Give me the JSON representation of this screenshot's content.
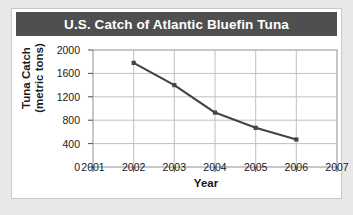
{
  "chart_data": {
    "type": "line",
    "title": "U.S. Catch of Atlantic Bluefin Tuna",
    "xlabel": "Year",
    "ylabel_line1": "Tuna Catch",
    "ylabel_line2": "(metric tons)",
    "x": [
      2002,
      2003,
      2004,
      2005,
      2006
    ],
    "values": [
      1780,
      1400,
      930,
      670,
      470
    ],
    "xticks": [
      "2001",
      "2002",
      "2003",
      "2004",
      "2005",
      "2006",
      "2007"
    ],
    "xlim": [
      2001,
      2007
    ],
    "yticks": [
      "0",
      "400",
      "800",
      "1200",
      "1600",
      "2000"
    ],
    "ylim": [
      0,
      2000
    ],
    "grid": true,
    "legend": "none",
    "series_color": "#444444",
    "title_bg_color": "#4f4f4f",
    "title_text_color": "#ffffff",
    "grid_color": "#b8b8b8",
    "page_bg_color": "#e9e8e6",
    "figure_bg_color": "#ffffff"
  }
}
